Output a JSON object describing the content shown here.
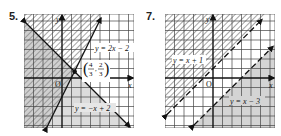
{
  "problems": [
    {
      "number": "5.",
      "axis_x_label": "x",
      "axis_y_label": "y",
      "origin_label": "O",
      "lines": [
        {
          "equation": "y = 2x − 2",
          "style": "solid",
          "slope": 2,
          "intercept": -2
        },
        {
          "equation": "y = −x + 2",
          "style": "solid",
          "slope": -1,
          "intercept": 2
        }
      ],
      "intersection": {
        "label_x": "4/3",
        "label_y": "2/3",
        "x": 1.3333,
        "y": 0.6667
      },
      "regions": {
        "hatched": "above y = −x + 2 and left of y = 2x − 2",
        "shaded": "below y = −x + 2 / left region"
      }
    },
    {
      "number": "7.",
      "axis_x_label": "x",
      "axis_y_label": "y",
      "origin_label": "O",
      "lines": [
        {
          "equation": "y = x + 1",
          "style": "dashed",
          "slope": 1,
          "intercept": 1
        },
        {
          "equation": "y = x − 3",
          "style": "dashed",
          "slope": 1,
          "intercept": -3
        }
      ],
      "regions": {
        "hatched": "above y = x + 1",
        "shaded": "below y = x − 3"
      }
    }
  ]
}
